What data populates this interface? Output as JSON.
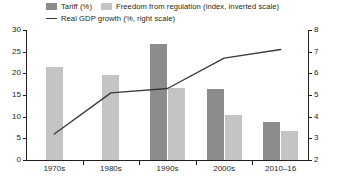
{
  "chart_data": {
    "type": "bar",
    "title": "",
    "subtitle": "",
    "xlabel": "",
    "ylabel": "",
    "y2label": "",
    "grid": false,
    "legend_position": "top",
    "categories": [
      "1970s",
      "1980s",
      "1990s",
      "2000s",
      "2010–16"
    ],
    "ylim": [
      0,
      30
    ],
    "yticks": [
      0,
      5,
      10,
      15,
      20,
      25,
      30
    ],
    "y2lim": [
      2,
      8
    ],
    "y2ticks": [
      2,
      3,
      4,
      5,
      6,
      7,
      8
    ],
    "series": [
      {
        "name": "Tariff (%)",
        "type": "bar",
        "axis": "left",
        "color": "#8c8c8c",
        "values": [
          null,
          null,
          26.8,
          16.3,
          8.7
        ]
      },
      {
        "name": "Freedom from regulation (index, inverted scale)",
        "type": "bar",
        "axis": "left",
        "color": "#c4c4c4",
        "values": [
          21.5,
          19.7,
          16.7,
          10.3,
          6.6
        ]
      },
      {
        "name": "Real GDP growth (%, right scale)",
        "type": "line",
        "axis": "right",
        "color": "#3a3a3a",
        "values": [
          3.2,
          5.1,
          5.3,
          6.7,
          7.1
        ]
      }
    ]
  },
  "legend": {
    "items": [
      {
        "label": "Tariff (%)",
        "marker": "swatch",
        "color": "#8c8c8c"
      },
      {
        "label": "Freedom from regulation (index, inverted scale)",
        "marker": "swatch",
        "color": "#c4c4c4"
      },
      {
        "label": "Real GDP growth (%, right scale)",
        "marker": "line",
        "color": "#3a3a3a"
      }
    ]
  },
  "axes": {
    "left_ticks": [
      "0",
      "5",
      "10",
      "15",
      "20",
      "25",
      "30"
    ],
    "right_ticks": [
      "2",
      "3",
      "4",
      "5",
      "6",
      "7",
      "8"
    ],
    "x_ticks": [
      "1970s",
      "1980s",
      "1990s",
      "2000s",
      "2010–16"
    ]
  }
}
